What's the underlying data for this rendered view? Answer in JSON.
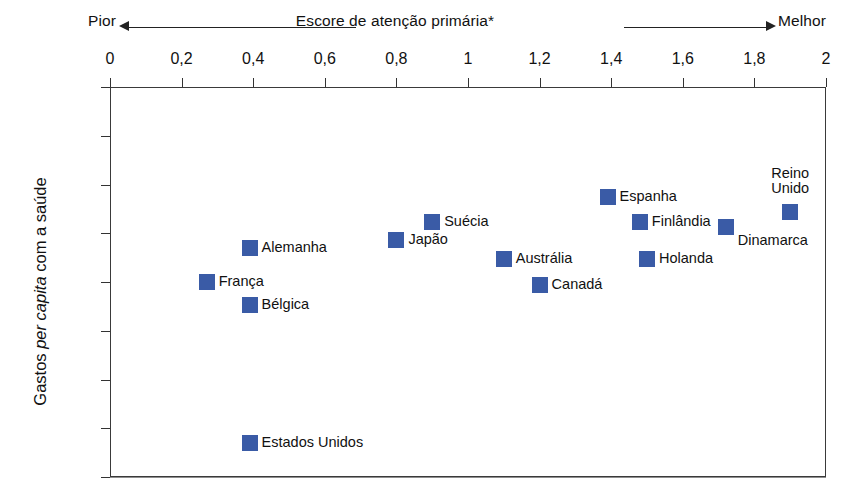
{
  "chart_data": {
    "type": "scatter",
    "title": "",
    "xlabel": "Escore de atenção primária*",
    "ylabel": "Gastos per capita com a saúde",
    "xlim": [
      0,
      2
    ],
    "ylim": [
      0,
      4000
    ],
    "y_inverted": true,
    "grid": "horizontal",
    "legend": "none",
    "axis_direction": {
      "left_label": "Pior",
      "right_label": "Melhor"
    },
    "x_ticks": [
      "0",
      "0,2",
      "0,4",
      "0,6",
      "0,8",
      "1",
      "1,2",
      "1,4",
      "1,6",
      "1,8",
      "2"
    ],
    "x_tick_values": [
      0,
      0.2,
      0.4,
      0.6,
      0.8,
      1,
      1.2,
      1.4,
      1.6,
      1.8,
      2
    ],
    "y_ticks": [
      "$0",
      "500",
      "1.000",
      "1.500",
      "2.000",
      "2.500",
      "3.000",
      "3.500",
      "4.000"
    ],
    "y_tick_values": [
      0,
      500,
      1000,
      1500,
      2000,
      2500,
      3000,
      3500,
      4000
    ],
    "marker_color": "#3a5ba6",
    "points": [
      {
        "label": "França",
        "x": 0.27,
        "y": 2000,
        "label_pos": "right"
      },
      {
        "label": "Alemanha",
        "x": 0.39,
        "y": 1650,
        "label_pos": "right"
      },
      {
        "label": "Bélgica",
        "x": 0.39,
        "y": 2240,
        "label_pos": "right"
      },
      {
        "label": "Estados Unidos",
        "x": 0.39,
        "y": 3650,
        "label_pos": "right"
      },
      {
        "label": "Japão",
        "x": 0.8,
        "y": 1570,
        "label_pos": "right"
      },
      {
        "label": "Suécia",
        "x": 0.9,
        "y": 1380,
        "label_pos": "right"
      },
      {
        "label": "Austrália",
        "x": 1.1,
        "y": 1760,
        "label_pos": "right"
      },
      {
        "label": "Canadá",
        "x": 1.2,
        "y": 2030,
        "label_pos": "right"
      },
      {
        "label": "Espanha",
        "x": 1.39,
        "y": 1130,
        "label_pos": "right"
      },
      {
        "label": "Finlândia",
        "x": 1.48,
        "y": 1380,
        "label_pos": "right"
      },
      {
        "label": "Holanda",
        "x": 1.5,
        "y": 1760,
        "label_pos": "right"
      },
      {
        "label": "Dinamarca",
        "x": 1.72,
        "y": 1440,
        "label_pos": "below-right"
      },
      {
        "label": "Reino Unido",
        "x": 1.9,
        "y": 1280,
        "label_pos": "above",
        "label_lines": [
          "Reino",
          "Unido"
        ]
      }
    ]
  }
}
